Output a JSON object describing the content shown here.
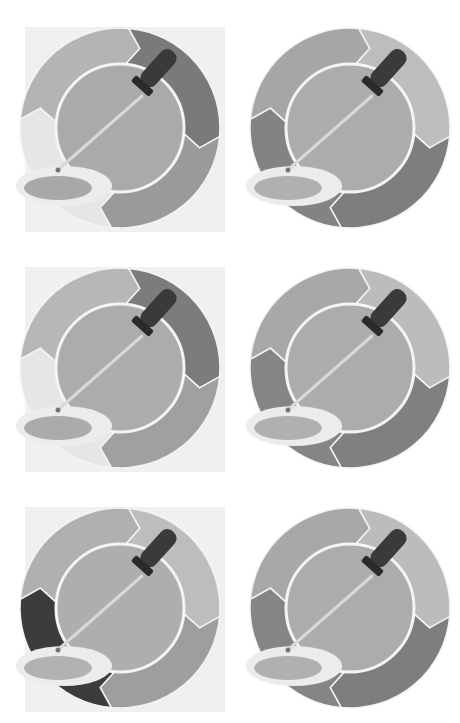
{
  "page": {
    "background": "#ffffff",
    "layout": "grid-2x3"
  },
  "icons": [
    {
      "name": "eyedropper-color-wheel-1",
      "position": {
        "row": 1,
        "col": 1
      },
      "square_background": true,
      "background_color": "#f0f0f0",
      "segments": {
        "top_left": "#b4b4b4",
        "top_right": "#7a7a7a",
        "bottom_right": "#9a9a9a",
        "bottom_left": "#e6e6e6"
      },
      "inner_circle": "#aaaaaa",
      "dish_fill": "#a8a8a8",
      "dish_rim": "#ececec"
    },
    {
      "name": "eyedropper-color-wheel-2",
      "position": {
        "row": 1,
        "col": 2
      },
      "square_background": false,
      "background_color": "#ffffff",
      "segments": {
        "top_left": "#a6a6a6",
        "top_right": "#bdbdbd",
        "bottom_right": "#7e7e7e",
        "bottom_left": "#838383"
      },
      "inner_circle": "#acacac",
      "dish_fill": "#b0b0b0",
      "dish_rim": "#ececec"
    },
    {
      "name": "eyedropper-color-wheel-3",
      "position": {
        "row": 2,
        "col": 1
      },
      "square_background": true,
      "background_color": "#f0f0f0",
      "segments": {
        "top_left": "#b7b7b7",
        "top_right": "#7c7c7c",
        "bottom_right": "#a0a0a0",
        "bottom_left": "#e6e6e6"
      },
      "inner_circle": "#acacac",
      "dish_fill": "#ababab",
      "dish_rim": "#ececec"
    },
    {
      "name": "eyedropper-color-wheel-4",
      "position": {
        "row": 2,
        "col": 2
      },
      "square_background": false,
      "background_color": "#ffffff",
      "segments": {
        "top_left": "#a8a8a8",
        "top_right": "#bcbcbc",
        "bottom_right": "#808080",
        "bottom_left": "#858585"
      },
      "inner_circle": "#acacac",
      "dish_fill": "#b0b0b0",
      "dish_rim": "#ececec"
    },
    {
      "name": "eyedropper-color-wheel-5",
      "position": {
        "row": 3,
        "col": 1
      },
      "square_background": true,
      "background_color": "#f0f0f0",
      "segments": {
        "top_left": "#b0b0b0",
        "top_right": "#bdbdbd",
        "bottom_right": "#9e9e9e",
        "bottom_left": "#3c3c3c"
      },
      "inner_circle": "#aeaeae",
      "dish_fill": "#b2b2b2",
      "dish_rim": "#ececec"
    },
    {
      "name": "eyedropper-color-wheel-6",
      "position": {
        "row": 3,
        "col": 2
      },
      "square_background": false,
      "background_color": "#ffffff",
      "segments": {
        "top_left": "#a8a8a8",
        "top_right": "#bcbcbc",
        "bottom_right": "#7e7e7e",
        "bottom_left": "#858585"
      },
      "inner_circle": "#acacac",
      "dish_fill": "#b0b0b0",
      "dish_rim": "#ececec"
    }
  ],
  "dropper": {
    "bulb_color": "#3a3a3a",
    "tube_color": "#d8d8d8"
  }
}
